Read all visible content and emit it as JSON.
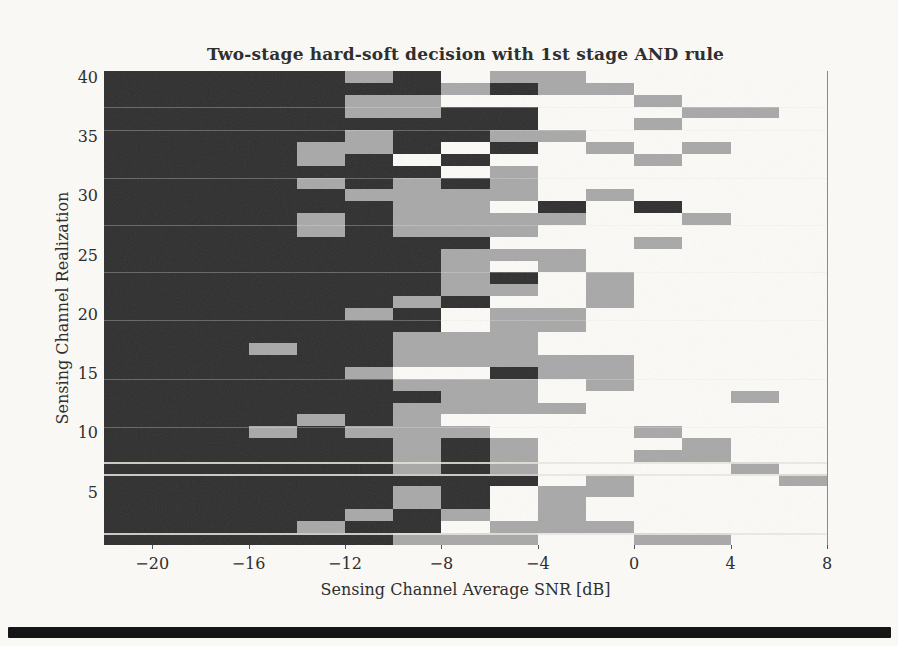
{
  "figure": {
    "title": "Two-stage hard-soft decision with 1st stage AND rule",
    "x_axis_label": "Sensing Channel Average SNR [dB]",
    "y_axis_label": "Sensing Channel Realization"
  },
  "chart_data": {
    "type": "heatmap",
    "title": "Two-stage hard-soft decision with 1st stage AND rule",
    "xlabel": "Sensing Channel Average SNR [dB]",
    "ylabel": "Sensing Channel Realization",
    "x_ticks": [
      -20,
      -16,
      -12,
      -8,
      -4,
      0,
      4,
      8
    ],
    "y_ticks": [
      40,
      35,
      30,
      25,
      20,
      15,
      10,
      5
    ],
    "xlim": [
      -22,
      8
    ],
    "ylim": [
      1,
      40
    ],
    "n_rows": 40,
    "n_cols": 15,
    "snr_bin_edges_db": [
      -22,
      -20,
      -18,
      -16,
      -14,
      -12,
      -10,
      -8,
      -6,
      -4,
      -2,
      0,
      2,
      4,
      6,
      8
    ],
    "grid_legend": "D=dark decision cell, G=gray decision cell, W=white decision cell; rows listed top (realization 40) to bottom (realization 1), 15 SNR bins left to right",
    "grid_rows_top_to_bottom": [
      "DDDDDGDWGGWWWWW",
      "DDDDDDDGDGGWWWW",
      "DDDDDGGWWWWGWWW",
      "DDDDDGGDDWWWGGW",
      "DDDDDDDDDWWGWWW",
      "DDDDDGDDGGWWWWW",
      "DDDDGGDWDWGWGWW",
      "DDDDGDWDWWWGWWW",
      "DDDDDDDWGWWWWWW",
      "DDDDGDGDGWWWWWW",
      "DDDDDGGGGWGWWWW",
      "DDDDDDGGWDWDWWW",
      "DDDDGDGGGGWWGWW",
      "DDDDGDGGGWWWWWW",
      "DDDDDDDDWWWGWWW",
      "DDDDDDDGGGWWWWW",
      "DDDDDDDGWGWWWWW",
      "DDDDDDDGDWGWWWW",
      "DDDDDDDGGWGWWWW",
      "DDDDDDGDWWGWWWW",
      "DDDDDGDWGGWWWWW",
      "DDDDDDDWGGWWWWW",
      "DDDDDDGGGWWWWWW",
      "DDDGDDGGGWWWWWW",
      "DDDDDDGGGGGWWWW",
      "DDDDDGWWDGGWWWW",
      "DDDDDDGGGWGWWWW",
      "DDDDDDDGGWWWWGW",
      "DDDDDDGGGGWWWWW",
      "DDDDGDGWWWWWWWW",
      "DDDGDGGGWWWGWWW",
      "DDDDDDGDGWWWGWW",
      "DDDDDDGDGWWGGWW",
      "DDDDDDGDGWWWWGW",
      "DDDDDDDDDWGWWWG",
      "DDDDDDGDWGGWWWW",
      "DDDDDDGDWGWWWWW",
      "DDDDDGDGWGWWWWW",
      "DDDDGDDWGGGWWWW",
      "DDDDDDGGGWWGGWW"
    ],
    "palette": {
      "D": "#2e2e2e",
      "G": "#a8a8a8",
      "W": "#fcfbf8",
      "page_background": "#faf8f4"
    },
    "grid_lines": "off",
    "legend": "none"
  }
}
